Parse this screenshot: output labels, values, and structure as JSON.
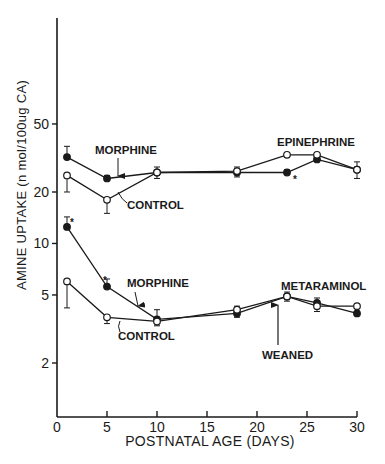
{
  "chart_data": {
    "type": "line",
    "title": "",
    "xlabel": "POSTNATAL AGE (DAYS)",
    "ylabel": "AMINE UPTAKE (n mol/100ug CA)",
    "yscale": "log",
    "xlim": [
      0,
      30
    ],
    "ylim": [
      1.2,
      150
    ],
    "x_ticks": [
      0,
      5,
      10,
      15,
      20,
      25,
      30
    ],
    "x_tick_labels": [
      "0",
      "5",
      "10",
      "15",
      "20",
      "25",
      "30"
    ],
    "y_ticks": [
      2,
      5,
      10,
      20,
      50
    ],
    "y_tick_labels": [
      "2",
      "5",
      "10",
      "20",
      "50"
    ],
    "grid": false,
    "legend": "none (inline annotations)",
    "x": [
      1,
      5,
      10,
      18,
      23,
      26,
      30
    ],
    "series": [
      {
        "name": "Epinephrine - Morphine",
        "marker": "filled-circle",
        "values": [
          32,
          24,
          26,
          26,
          26,
          31,
          27
        ],
        "err_plus": [
          5,
          1,
          2,
          2,
          1,
          2,
          3
        ]
      },
      {
        "name": "Epinephrine - Control",
        "marker": "open-circle",
        "values": [
          25,
          18,
          26,
          26.5,
          33,
          33,
          27
        ],
        "err_minus": [
          5,
          3,
          2,
          2,
          1,
          2,
          3
        ]
      },
      {
        "name": "Metaraminol - Morphine",
        "marker": "filled-circle",
        "values": [
          12.5,
          5.6,
          3.6,
          3.9,
          4.9,
          4.5,
          3.9
        ],
        "err_plus": [
          1.8,
          0.6,
          0.5,
          0.4,
          0.3,
          0.3,
          0.3
        ]
      },
      {
        "name": "Metaraminol - Control",
        "marker": "open-circle",
        "values": [
          6.0,
          3.7,
          3.5,
          4.1,
          4.9,
          4.3,
          4.3
        ],
        "err_minus": [
          1.8,
          0.3,
          0.2,
          0.4,
          0.3,
          0.3,
          0.3
        ]
      }
    ],
    "annotations": [
      {
        "text": "MORPHINE",
        "target": "Epinephrine - Morphine"
      },
      {
        "text": "CONTROL",
        "target": "Epinephrine - Control"
      },
      {
        "text": "EPINEPHRINE",
        "target": "upper curve group"
      },
      {
        "text": "MORPHINE",
        "target": "Metaraminol - Morphine"
      },
      {
        "text": "CONTROL",
        "target": "Metaraminol - Control"
      },
      {
        "text": "METARAMINOL",
        "target": "lower curve group"
      },
      {
        "text": "WEANED",
        "target": "day ~22 arrow"
      },
      {
        "text": "*",
        "target": "significant points: day 1 & 5 metaraminol morphine, day 23 epinephrine morphine"
      }
    ]
  },
  "labels": {
    "ylabel": "AMINE UPTAKE (n mol/100ug CA)",
    "xlabel": "POSTNATAL AGE (DAYS)",
    "epi_morphine": "MORPHINE",
    "epi_control": "CONTROL",
    "epi_title": "EPINEPHRINE",
    "meta_morphine": "MORPHINE",
    "meta_control": "CONTROL",
    "meta_title": "METARAMINOL",
    "weaned": "WEANED",
    "star": "*"
  }
}
